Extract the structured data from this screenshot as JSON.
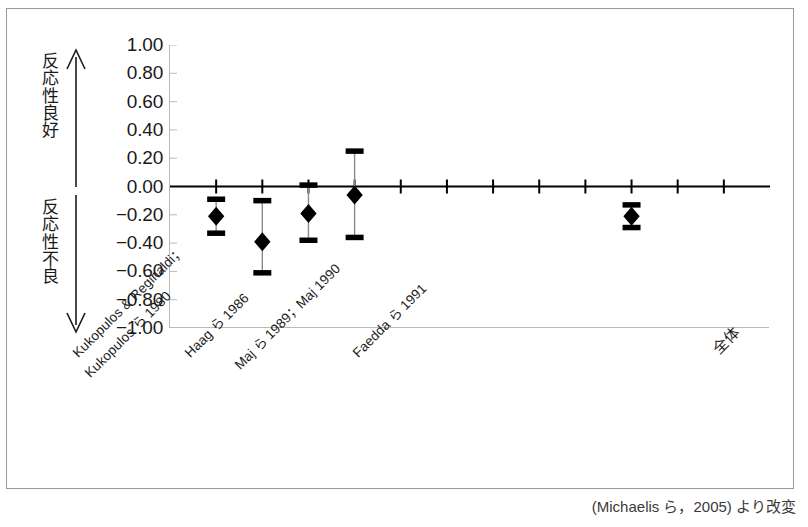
{
  "figure": {
    "caption": "(Michaelis ら，2005) より改変"
  },
  "axis": {
    "y_ticks": [
      "1.00",
      "0.80",
      "0.60",
      "0.40",
      "0.20",
      "0.00",
      "-0.20",
      "-0.40",
      "-0.60",
      "-0.80",
      "-1.00"
    ],
    "annotation_good": "反応性良好",
    "annotation_poor": "反応性不良",
    "arrow_up_icon": "arrow-up-icon",
    "arrow_down_icon": "arrow-down-icon"
  },
  "chart_data": {
    "type": "scatter",
    "title": "",
    "subtitle": "",
    "xlabel": "",
    "ylabel": "",
    "ylim": [
      -1.0,
      1.0
    ],
    "ytick_step": 0.2,
    "grid": false,
    "legend": "none",
    "zero_line": 0.0,
    "x_tick_count": 12,
    "categories": [
      "Kukopulos & Reginaldi；Kukopulos ら 1980",
      "Haag ら 1986",
      "Maj ら 1989；Maj 1990",
      "Faedda ら 1991",
      "全体"
    ],
    "points": [
      {
        "label": "Kukopulos & Reginaldi；Kukopulos ら 1980",
        "x_index": 1,
        "value": -0.21,
        "ci_low": -0.33,
        "ci_high": -0.09
      },
      {
        "label": "Haag ら 1986",
        "x_index": 2,
        "value": -0.39,
        "ci_low": -0.61,
        "ci_high": -0.1
      },
      {
        "label": "Maj ら 1989；Maj 1990",
        "x_index": 3,
        "value": -0.19,
        "ci_low": -0.38,
        "ci_high": 0.01
      },
      {
        "label": "Faedda ら 1991",
        "x_index": 4,
        "value": -0.06,
        "ci_low": -0.36,
        "ci_high": 0.25
      },
      {
        "label": "全体",
        "x_index": 10,
        "value": -0.21,
        "ci_low": -0.29,
        "ci_high": -0.13
      }
    ],
    "series": [
      {
        "name": "効果量",
        "values": [
          -0.21,
          -0.39,
          -0.19,
          -0.06,
          -0.21
        ],
        "ci_low": [
          -0.33,
          -0.61,
          -0.38,
          -0.36,
          -0.29
        ],
        "ci_high": [
          -0.09,
          -0.1,
          0.01,
          0.25,
          -0.13
        ]
      }
    ],
    "marker": "diamond",
    "marker_color": "#000000",
    "errorbar_color": "#000000"
  },
  "xlabels": [
    {
      "text": "Kukopulos & Reginaldi；",
      "left": 60,
      "top": 338,
      "cjk": false
    },
    {
      "text": "Kukopulos ら 1980",
      "left": 72,
      "top": 358,
      "cjk": false
    },
    {
      "text": "Haag ら 1986",
      "left": 172,
      "top": 338,
      "cjk": false
    },
    {
      "text": "Maj ら 1989；Maj 1990",
      "left": 222,
      "top": 350,
      "cjk": false
    },
    {
      "text": "Faedda ら 1991",
      "left": 340,
      "top": 338,
      "cjk": false
    },
    {
      "text": "全体",
      "left": 700,
      "top": 334,
      "cjk": true
    }
  ]
}
